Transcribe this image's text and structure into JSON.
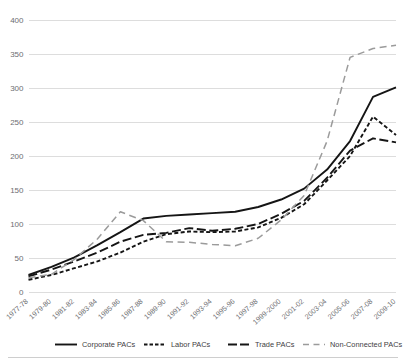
{
  "chart_data": {
    "type": "line",
    "title": "",
    "subtitle": "",
    "xlabel": "",
    "ylabel": "",
    "ylim": [
      0,
      400
    ],
    "ytick_values": [
      0,
      50,
      100,
      150,
      200,
      250,
      300,
      350,
      400
    ],
    "ytick_labels": [
      "0",
      "50",
      "100",
      "150",
      "200",
      "250",
      "300",
      "350",
      "400"
    ],
    "grid": true,
    "legend_position": "bottom",
    "categories": [
      "1977-78",
      "1979-80",
      "1981-82",
      "1983-84",
      "1985-86",
      "1987-88",
      "1989-90",
      "1991-92",
      "1993-94",
      "1995-96",
      "1997-98",
      "1999-2000",
      "2001-02",
      "2003-04",
      "2005-06",
      "2007-08",
      "2009-10"
    ],
    "series": [
      {
        "name": "Corporate PACs",
        "style": "solid",
        "color": "#151515",
        "width": 1.9,
        "dash": "",
        "values": [
          25,
          37,
          51,
          69,
          88,
          108,
          112,
          114,
          116,
          118,
          125,
          136,
          152,
          180,
          222,
          287,
          301
        ]
      },
      {
        "name": "Labor PACs",
        "style": "dotted-dash",
        "color": "#151515",
        "width": 1.9,
        "dash": "4,2.4",
        "values": [
          18,
          25,
          35,
          45,
          58,
          74,
          85,
          89,
          88,
          89,
          95,
          109,
          129,
          164,
          200,
          258,
          231
        ]
      },
      {
        "name": "Trade PACs",
        "style": "long-dash",
        "color": "#151515",
        "width": 1.9,
        "dash": "9,3.6",
        "values": [
          23,
          33,
          45,
          58,
          74,
          84,
          87,
          94,
          90,
          93,
          100,
          115,
          134,
          168,
          208,
          226,
          220
        ]
      },
      {
        "name": "Non-Connected PACs",
        "style": "wide-dash-gray",
        "color": "#9b9b9b",
        "width": 1.5,
        "dash": "7,4.5",
        "values": [
          21,
          26,
          48,
          78,
          118,
          105,
          74,
          73,
          70,
          68,
          79,
          106,
          142,
          222,
          345,
          358,
          363
        ]
      }
    ],
    "legend": [
      {
        "label": "Corporate PACs",
        "swatch": "solid",
        "color": "#151515",
        "dash": ""
      },
      {
        "label": "Labor PACs",
        "swatch": "dotted-dash",
        "color": "#151515",
        "dash": "3.5,2"
      },
      {
        "label": "Trade PACs",
        "swatch": "long-dash",
        "color": "#151515",
        "dash": "9,3"
      },
      {
        "label": "Non-Connected PACs",
        "swatch": "wide-dash-gray",
        "color": "#9b9b9b",
        "dash": "6,4.5"
      }
    ]
  }
}
